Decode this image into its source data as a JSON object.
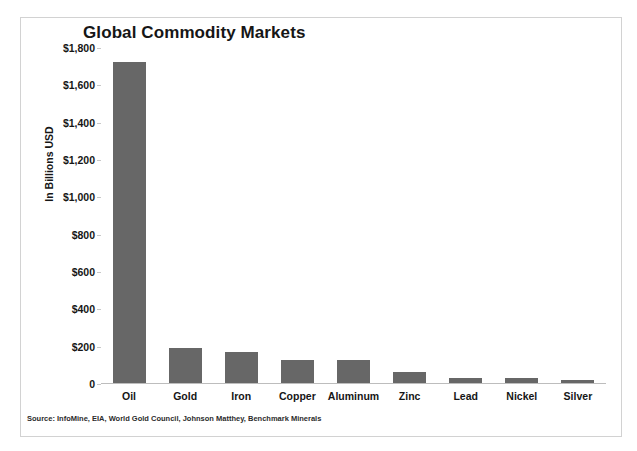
{
  "chart_data": {
    "type": "bar",
    "title": "Global Commodity Markets",
    "xlabel": "",
    "ylabel": "In Billions USD",
    "categories": [
      "Oil",
      "Gold",
      "Iron",
      "Copper",
      "Aluminum",
      "Zinc",
      "Lead",
      "Nickel",
      "Silver"
    ],
    "values": [
      1720,
      190,
      165,
      125,
      125,
      60,
      25,
      25,
      15
    ],
    "ylim": [
      0,
      1800
    ],
    "ytick_values": [
      1800,
      1600,
      1400,
      1200,
      1000,
      800,
      600,
      400,
      200,
      0
    ],
    "ytick_labels": [
      "$1,800",
      "$1,600",
      "$1,400",
      "$1,200",
      "$1,000",
      "$800",
      "$600",
      "$400",
      "$200",
      "0"
    ],
    "grid": false,
    "legend": null,
    "bar_color": "#676767",
    "source_note": "Source: InfoMine, EIA, World Gold Council, Johnson Matthey, Benchmark Minerals"
  },
  "figure": {
    "border_color": "#d2d2d2",
    "background": "#ffffff"
  }
}
